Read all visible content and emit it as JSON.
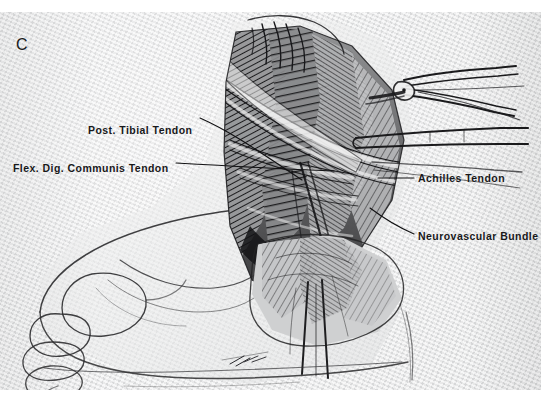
{
  "figure": {
    "panel_letter": "C",
    "type": "surgical-anatomical-illustration",
    "style": "grayscale pen-and-ink halftone reproduction",
    "background_color": "#ebeced",
    "ink_color": "#18181a",
    "page_background": "#ffffff"
  },
  "labels": [
    {
      "id": "post-tibial-tendon",
      "text": "Post. Tibial Tendon",
      "side": "left",
      "x": 88,
      "y": 112
    },
    {
      "id": "flex-dig-communis-tendon",
      "text": "Flex. Dig. Communis Tendon",
      "side": "left",
      "x": 13,
      "y": 150
    },
    {
      "id": "achilles-tendon",
      "text": "Achilles Tendon",
      "side": "right",
      "x": 418,
      "y": 160
    },
    {
      "id": "neurovascular-bundle",
      "text": "Neurovascular Bundle",
      "side": "right",
      "x": 418,
      "y": 218
    }
  ],
  "leader_lines": [
    {
      "id": "leader-post-tibial",
      "from": [
        200,
        118
      ],
      "to": [
        300,
        168
      ]
    },
    {
      "id": "leader-flex-dig",
      "from": [
        176,
        157
      ],
      "to": [
        330,
        159
      ]
    },
    {
      "id": "leader-achilles",
      "from": [
        416,
        166
      ],
      "to": [
        378,
        166
      ]
    },
    {
      "id": "leader-neuro",
      "from": [
        416,
        224
      ],
      "to": [
        372,
        200
      ]
    }
  ]
}
